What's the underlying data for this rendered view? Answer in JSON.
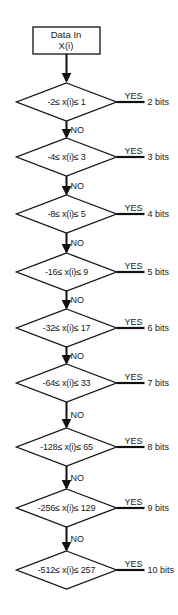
{
  "diagram": {
    "type": "flowchart",
    "start": {
      "line1": "Data In",
      "line2": "X(i)"
    },
    "no_label": "NO",
    "yes_label": "YES",
    "decisions": [
      {
        "condition": "-2≤ x(i)≤ 1",
        "low": -2,
        "high": 1,
        "result": "2 bits"
      },
      {
        "condition": "-4≤ x(i)≤ 3",
        "low": -4,
        "high": 3,
        "result": "3 bits"
      },
      {
        "condition": "-8≤ x(i)≤ 5",
        "low": -8,
        "high": 5,
        "result": "4 bits"
      },
      {
        "condition": "-16≤ x(i)≤ 9",
        "low": -16,
        "high": 9,
        "result": "5 bits"
      },
      {
        "condition": "-32≤ x(i)≤ 17",
        "low": -32,
        "high": 17,
        "result": "6 bits"
      },
      {
        "condition": "-64≤ x(i)≤ 33",
        "low": -64,
        "high": 33,
        "result": "7 bits"
      },
      {
        "condition": "-128≤ x(i)≤ 65",
        "low": -128,
        "high": 65,
        "result": "8 bits"
      },
      {
        "condition": "-256≤ x(i)≤ 129",
        "low": -256,
        "high": 129,
        "result": "9 bits"
      },
      {
        "condition": "-512≤ x(i)≤ 257",
        "low": -512,
        "high": 257,
        "result": "10 bits"
      }
    ],
    "colors": {
      "line": "#111111",
      "background": "#ffffff",
      "text": "#1a1a1a"
    }
  }
}
